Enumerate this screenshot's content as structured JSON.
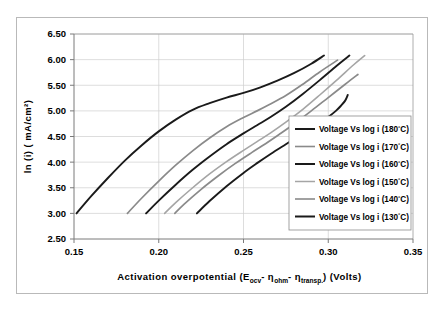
{
  "chart_data": {
    "type": "line",
    "title": "",
    "xlabel": "Activation overpotential (Eocv- ηohm- ηtransp.) (Volts)",
    "xlabel_parts": {
      "lead": "Activation overpotential (E",
      "sub1": "ocv",
      "mid1": "- η",
      "sub2": "ohm",
      "mid2": "- η",
      "sub3": "transp.",
      "tail": ") (Volts)"
    },
    "ylabel": "ln (i) ( mA/cm²)",
    "xlim": [
      0.15,
      0.35
    ],
    "ylim": [
      2.5,
      6.5
    ],
    "xticks": [
      0.15,
      0.2,
      0.25,
      0.3,
      0.35
    ],
    "xtick_labels": [
      "0.15",
      "0.20",
      "0.25",
      "0.30",
      "0.35"
    ],
    "yticks": [
      2.5,
      3.0,
      3.5,
      4.0,
      4.5,
      5.0,
      5.5,
      6.0,
      6.5
    ],
    "ytick_labels": [
      "2.50",
      "3.00",
      "3.50",
      "4.00",
      "4.50",
      "5.00",
      "5.50",
      "6.00",
      "6.50"
    ],
    "grid": true,
    "grid_axes": "both",
    "legend_position": "right-lower",
    "series": [
      {
        "name": "Voltage Vs log i (180°C)",
        "temperature": "180°C",
        "color": "#1a1a1a",
        "width": 1.9,
        "points": [
          [
            0.1515,
            3.0
          ],
          [
            0.16,
            3.33
          ],
          [
            0.17,
            3.69
          ],
          [
            0.18,
            4.03
          ],
          [
            0.19,
            4.33
          ],
          [
            0.2,
            4.6
          ],
          [
            0.21,
            4.83
          ],
          [
            0.22,
            5.02
          ],
          [
            0.23,
            5.15
          ],
          [
            0.24,
            5.26
          ],
          [
            0.25,
            5.35
          ],
          [
            0.26,
            5.46
          ],
          [
            0.27,
            5.59
          ],
          [
            0.28,
            5.74
          ],
          [
            0.29,
            5.92
          ],
          [
            0.2975,
            6.08
          ]
        ]
      },
      {
        "name": "Voltage Vs log i (170°C)",
        "temperature": "170°C",
        "color": "#8a8a8a",
        "width": 1.7,
        "points": [
          [
            0.1815,
            3.0
          ],
          [
            0.19,
            3.3
          ],
          [
            0.2,
            3.63
          ],
          [
            0.21,
            3.94
          ],
          [
            0.22,
            4.22
          ],
          [
            0.23,
            4.47
          ],
          [
            0.24,
            4.69
          ],
          [
            0.25,
            4.87
          ],
          [
            0.258,
            5.0
          ],
          [
            0.265,
            5.12
          ],
          [
            0.275,
            5.3
          ],
          [
            0.285,
            5.52
          ],
          [
            0.295,
            5.76
          ],
          [
            0.3055,
            5.99
          ]
        ]
      },
      {
        "name": "Voltage Vs log i (160°C)",
        "temperature": "160°C",
        "color": "#1a1a1a",
        "width": 1.9,
        "points": [
          [
            0.1925,
            3.0
          ],
          [
            0.2,
            3.25
          ],
          [
            0.21,
            3.56
          ],
          [
            0.22,
            3.85
          ],
          [
            0.23,
            4.11
          ],
          [
            0.24,
            4.35
          ],
          [
            0.25,
            4.56
          ],
          [
            0.258,
            4.72
          ],
          [
            0.266,
            4.88
          ],
          [
            0.275,
            5.08
          ],
          [
            0.285,
            5.33
          ],
          [
            0.295,
            5.6
          ],
          [
            0.305,
            5.88
          ],
          [
            0.3125,
            6.08
          ]
        ]
      },
      {
        "name": "Voltage Vs log i (150°C)",
        "temperature": "150°C",
        "color": "#a5a5a5",
        "width": 1.6,
        "points": [
          [
            0.2035,
            3.0
          ],
          [
            0.21,
            3.21
          ],
          [
            0.22,
            3.5
          ],
          [
            0.23,
            3.77
          ],
          [
            0.24,
            4.01
          ],
          [
            0.25,
            4.23
          ],
          [
            0.258,
            4.4
          ],
          [
            0.266,
            4.57
          ],
          [
            0.275,
            4.78
          ],
          [
            0.285,
            5.03
          ],
          [
            0.295,
            5.31
          ],
          [
            0.305,
            5.6
          ],
          [
            0.315,
            5.9
          ],
          [
            0.3215,
            6.08
          ]
        ]
      },
      {
        "name": "Voltage Vs log i (140°C)",
        "temperature": "140°C",
        "color": "#8a8a8a",
        "width": 1.7,
        "points": [
          [
            0.2095,
            3.0
          ],
          [
            0.215,
            3.18
          ],
          [
            0.225,
            3.47
          ],
          [
            0.235,
            3.73
          ],
          [
            0.245,
            3.97
          ],
          [
            0.255,
            4.19
          ],
          [
            0.263,
            4.36
          ],
          [
            0.271,
            4.54
          ],
          [
            0.28,
            4.75
          ],
          [
            0.29,
            5.0
          ],
          [
            0.3,
            5.26
          ],
          [
            0.31,
            5.52
          ],
          [
            0.3175,
            5.71
          ]
        ]
      },
      {
        "name": "Voltage Vs log i (130°C)",
        "temperature": "130°C",
        "color": "#1a1a1a",
        "width": 1.9,
        "points": [
          [
            0.2225,
            3.0
          ],
          [
            0.23,
            3.24
          ],
          [
            0.24,
            3.53
          ],
          [
            0.25,
            3.79
          ],
          [
            0.258,
            3.98
          ],
          [
            0.266,
            4.16
          ],
          [
            0.275,
            4.35
          ],
          [
            0.285,
            4.56
          ],
          [
            0.295,
            4.77
          ],
          [
            0.3,
            4.88
          ],
          [
            0.3045,
            5.0
          ],
          [
            0.3075,
            5.1
          ],
          [
            0.31,
            5.2
          ],
          [
            0.3115,
            5.31
          ]
        ]
      }
    ]
  },
  "legend": {
    "entries": [
      {
        "label_prefix": "Voltage Vs log i (180",
        "label_sup": "°",
        "label_suffix": "C)",
        "color": "#1a1a1a"
      },
      {
        "label_prefix": "Voltage Vs log i (170",
        "label_sup": "°",
        "label_suffix": "C)",
        "color": "#8a8a8a"
      },
      {
        "label_prefix": "Voltage Vs log i (160",
        "label_sup": "°",
        "label_suffix": "C)",
        "color": "#1a1a1a"
      },
      {
        "label_prefix": "Voltage Vs log i (150",
        "label_sup": "°",
        "label_suffix": "C)",
        "color": "#a5a5a5"
      },
      {
        "label_prefix": "Voltage Vs log i (140",
        "label_sup": "°",
        "label_suffix": "C)",
        "color": "#8a8a8a"
      },
      {
        "label_prefix": "Voltage Vs log i (130",
        "label_sup": "°",
        "label_suffix": "C)",
        "color": "#1a1a1a"
      }
    ]
  },
  "style": {
    "background": "#ffffff",
    "grid_color": "#cfcfcf",
    "axis_color": "#7a7a7a",
    "border_color": "#b9b9b9",
    "text_color": "#000000"
  }
}
